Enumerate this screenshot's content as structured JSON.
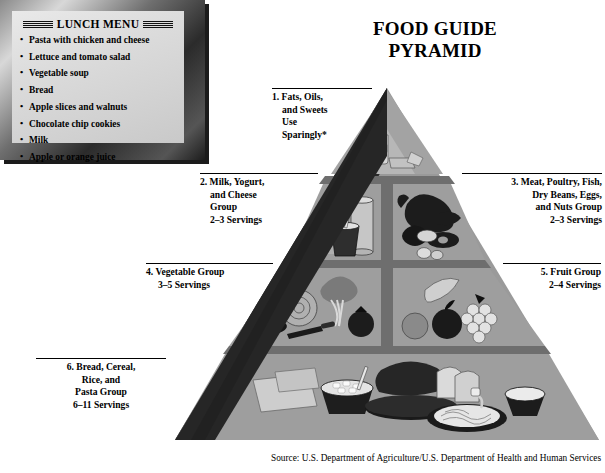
{
  "menu": {
    "title": "LUNCH MENU",
    "items": [
      "Pasta with chicken and cheese",
      "Lettuce and tomato salad",
      "Vegetable soup",
      "Bread",
      "Apple slices and walnuts",
      "Chocolate chip cookies",
      "Milk",
      "Apple or orange juice"
    ]
  },
  "heading": {
    "line1": "FOOD GUIDE",
    "line2": "PYRAMID",
    "full": "FOOD GUIDE PYRAMID"
  },
  "pyramid": {
    "labels": [
      {
        "number": "1.",
        "name": "fats-oils-sweets",
        "lines": [
          "1. Fats, Oils,",
          "and Sweets",
          "Use",
          "Sparingly*"
        ],
        "servings": "Use Sparingly*"
      },
      {
        "number": "2.",
        "name": "milk-yogurt-cheese",
        "lines": [
          "2. Milk, Yogurt,",
          "and Cheese",
          "Group",
          "2–3 Servings"
        ],
        "servings": "2–3 Servings"
      },
      {
        "number": "3.",
        "name": "meat-poultry-fish",
        "lines": [
          "3. Meat, Poultry, Fish,",
          "Dry Beans, Eggs,",
          "and Nuts Group",
          "2–3 Servings"
        ],
        "servings": "2–3 Servings"
      },
      {
        "number": "4.",
        "name": "vegetable-group",
        "lines": [
          "4. Vegetable Group",
          "3–5 Servings"
        ],
        "servings": "3–5 Servings"
      },
      {
        "number": "5.",
        "name": "fruit-group",
        "lines": [
          "5. Fruit Group",
          "2–4 Servings"
        ],
        "servings": "2–4 Servings"
      },
      {
        "number": "6.",
        "name": "bread-cereal-rice-pasta",
        "lines": [
          "6. Bread, Cereal,",
          "Rice, and",
          "Pasta Group",
          "6–11 Servings"
        ],
        "servings": "6–11 Servings"
      }
    ],
    "tiers": [
      {
        "name": "apex-fats-oils-sweets",
        "cells": [
          "fats-oils-sweets"
        ]
      },
      {
        "name": "tier-dairy-protein",
        "cells": [
          "milk-yogurt-cheese",
          "meat-poultry-fish"
        ]
      },
      {
        "name": "tier-produce",
        "cells": [
          "vegetable-group",
          "fruit-group"
        ]
      },
      {
        "name": "base-grains",
        "cells": [
          "bread-cereal-rice-pasta"
        ]
      }
    ],
    "oil_bottle_label": "OIL"
  },
  "source": "Source: U.S. Department of Agriculture/U.S. Department of Health and Human Services",
  "colors": {
    "pyramid_face": "#9a9a9a",
    "pyramid_cell": "#9e9e9e",
    "pyramid_divider": "#6e6e6e",
    "pyramid_shadow": "#2a2a2a",
    "background": "#ffffff",
    "text": "#000000",
    "menu_frame": "#2b2b2b",
    "menu_paper": "#dcdcdc"
  }
}
